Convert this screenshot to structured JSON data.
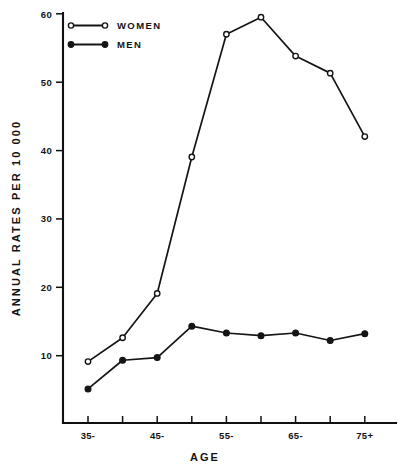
{
  "chart_data": {
    "type": "line",
    "title": "",
    "xlabel": "AGE",
    "ylabel": "ANNUAL RATES PER 10 000",
    "categories": [
      "35-",
      "40-",
      "45-",
      "50-",
      "55-",
      "60-",
      "65-",
      "70-",
      "75+"
    ],
    "xtick_labels_shown": [
      "35-",
      "",
      "45-",
      "",
      "55-",
      "",
      "65-",
      "",
      "75+"
    ],
    "ytick_labels": [
      "10",
      "20",
      "30",
      "40",
      "50",
      "60"
    ],
    "ytick_values": [
      10,
      20,
      30,
      40,
      50,
      60
    ],
    "ylim": [
      0,
      60
    ],
    "grid": false,
    "legend_position": "top-left",
    "series": [
      {
        "name": "WOMEN",
        "marker": "open-circle",
        "values": [
          9.0,
          12.5,
          19.0,
          39.0,
          57.0,
          59.5,
          53.8,
          51.3,
          42.0
        ]
      },
      {
        "name": "MEN",
        "marker": "filled-circle",
        "values": [
          5.0,
          9.2,
          9.6,
          14.2,
          13.2,
          12.8,
          13.2,
          12.1,
          13.1
        ]
      }
    ]
  },
  "legend": {
    "entries": [
      {
        "label": "WOMEN"
      },
      {
        "label": "MEN"
      }
    ]
  },
  "axes": {
    "x_title": "AGE",
    "y_title": "ANNUAL RATES PER 10 000"
  },
  "colors": {
    "ink": "#151515",
    "background": "#ffffff"
  }
}
